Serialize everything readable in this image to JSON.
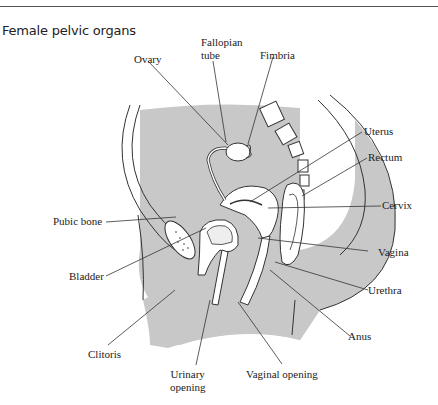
{
  "figure": {
    "title": "Female pelvic organs",
    "colors": {
      "shade": "#c8c8c8",
      "line": "#333333",
      "background": "#ffffff"
    },
    "labels": [
      {
        "id": "ovary",
        "text": "Ovary"
      },
      {
        "id": "fallopian_tube",
        "lines": [
          "Fallopian",
          "tube"
        ]
      },
      {
        "id": "fimbria",
        "text": "Fimbria"
      },
      {
        "id": "uterus",
        "text": "Uterus"
      },
      {
        "id": "rectum",
        "text": "Rectum"
      },
      {
        "id": "cervix",
        "text": "Cervix"
      },
      {
        "id": "pubic_bone",
        "text": "Pubic bone"
      },
      {
        "id": "vagina",
        "text": "Vagina"
      },
      {
        "id": "bladder",
        "text": "Bladder"
      },
      {
        "id": "urethra",
        "text": "Urethra"
      },
      {
        "id": "anus",
        "text": "Anus"
      },
      {
        "id": "clitoris",
        "text": "Clitoris"
      },
      {
        "id": "urinary_opening",
        "lines": [
          "Urinary",
          "opening"
        ]
      },
      {
        "id": "vaginal_opening",
        "text": "Vaginal opening"
      }
    ]
  }
}
